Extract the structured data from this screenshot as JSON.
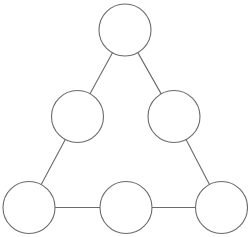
{
  "figure": {
    "background_color": "#ffffff",
    "stroke_color": "#6a6a6a",
    "node_fill_color": "#ffffff",
    "stroke_width": 1.1,
    "canvas": {
      "width": 248,
      "height": 237
    }
  },
  "chart_data": {
    "type": "diagram",
    "subtitle": "",
    "xlabel": "",
    "ylabel": "",
    "layout": "triangular arrangement, three rows: 1 top, 2 middle, 3 bottom",
    "node_radius": 26,
    "node_count": 6,
    "edge_count": 6,
    "nodes": [
      {
        "id": "top",
        "label": "",
        "cx": 125.0,
        "cy": 30.0,
        "r": 26,
        "row": 1,
        "position": "apex"
      },
      {
        "id": "mid-left",
        "label": "",
        "cx": 77.5,
        "cy": 116.5,
        "r": 26,
        "row": 2,
        "position": "left"
      },
      {
        "id": "mid-right",
        "label": "",
        "cx": 174.0,
        "cy": 116.5,
        "r": 26,
        "row": 2,
        "position": "right"
      },
      {
        "id": "bottom-left",
        "label": "",
        "cx": 29.0,
        "cy": 207.5,
        "r": 26,
        "row": 3,
        "position": "left"
      },
      {
        "id": "bottom-center",
        "label": "",
        "cx": 126.0,
        "cy": 207.5,
        "r": 26,
        "row": 3,
        "position": "center"
      },
      {
        "id": "bottom-right",
        "label": "",
        "cx": 221.5,
        "cy": 207.5,
        "r": 26,
        "row": 3,
        "position": "right"
      }
    ],
    "edges": [
      {
        "id": "edge-top-midleft",
        "from": "top",
        "to": "mid-left"
      },
      {
        "id": "edge-top-midright",
        "from": "top",
        "to": "mid-right"
      },
      {
        "id": "edge-midleft-bottomleft",
        "from": "mid-left",
        "to": "bottom-left"
      },
      {
        "id": "edge-midright-bottomright",
        "from": "mid-right",
        "to": "bottom-right"
      },
      {
        "id": "edge-bottomleft-bottomcenter",
        "from": "bottom-left",
        "to": "bottom-center"
      },
      {
        "id": "edge-bottomcenter-bottomright",
        "from": "bottom-center",
        "to": "bottom-right"
      }
    ]
  }
}
